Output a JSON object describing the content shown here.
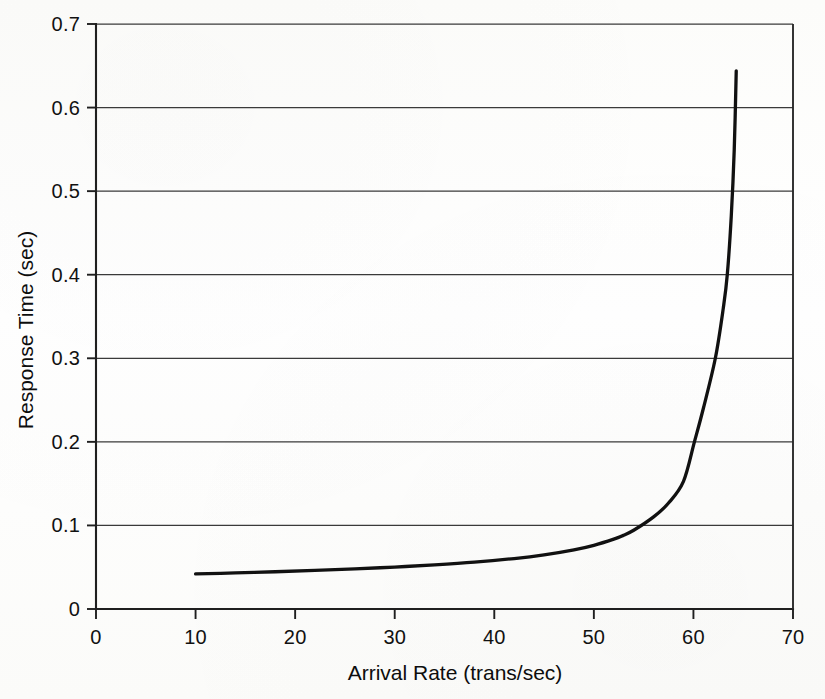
{
  "chart_data": {
    "type": "line",
    "title": "",
    "xlabel": "Arrival Rate (trans/sec)",
    "ylabel": "Response Time (sec)",
    "xlim": [
      0,
      70
    ],
    "ylim": [
      0,
      0.7
    ],
    "xticks": [
      0,
      10,
      20,
      30,
      40,
      50,
      60,
      70
    ],
    "yticks": [
      0,
      0.1,
      0.2,
      0.3,
      0.4,
      0.5,
      0.6,
      0.7
    ],
    "xtick_labels": [
      "0",
      "10",
      "20",
      "30",
      "40",
      "50",
      "60",
      "70"
    ],
    "ytick_labels": [
      "0",
      "0.1",
      "0.2",
      "0.3",
      "0.4",
      "0.5",
      "0.6",
      "0.7"
    ],
    "grid": "horizontal",
    "legend": "none",
    "series": [
      {
        "name": "Response Time",
        "x": [
          10,
          14,
          18,
          22,
          26,
          30,
          34,
          38,
          42,
          45,
          48,
          50,
          52,
          52.9,
          54,
          56,
          57.5,
          59,
          60.1,
          61,
          62.2,
          63,
          63.4,
          63.8,
          64.1,
          64.3
        ],
        "y": [
          0.042,
          0.0432,
          0.0446,
          0.0462,
          0.048,
          0.0502,
          0.0528,
          0.056,
          0.0604,
          0.0648,
          0.0708,
          0.0762,
          0.0836,
          0.0878,
          0.0942,
          0.1102,
          0.1268,
          0.1528,
          0.2,
          0.2402,
          0.3,
          0.36,
          0.4,
          0.47,
          0.55,
          0.644
        ]
      }
    ],
    "axis_color": "#1f1f1f",
    "curve_color": "#111111",
    "grid_color": "#3a3a3a",
    "background_color": "#fdfdfc"
  },
  "figure": {
    "caption": ""
  }
}
